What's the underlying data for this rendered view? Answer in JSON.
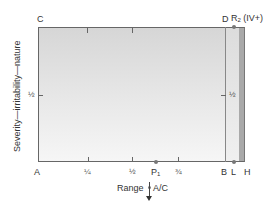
{
  "diagram": {
    "y_axis_label": "Severity—irritability—nature",
    "x_axis_label": "Range",
    "corners": {
      "top_left": "C",
      "top_right": "D",
      "bottom_left": "A",
      "bottom_right": "B"
    },
    "x_ticks": [
      {
        "label": "¼",
        "position": 0.25
      },
      {
        "label": "½",
        "position": 0.5
      },
      {
        "label": "¾",
        "position": 0.75
      }
    ],
    "y_tick_left": "½",
    "y_tick_right": "½",
    "points": {
      "p1": {
        "label": "P",
        "subscript": "1"
      },
      "r2": {
        "label": "R",
        "subscript": "2",
        "suffix": "(IV+)"
      },
      "l": {
        "label": "L"
      },
      "h": {
        "label": "H"
      }
    },
    "ac_marker": {
      "label": "A/C",
      "direction": "down"
    },
    "colors": {
      "plot_top": "#d6d6d6",
      "plot_bottom": "#f6f6f6",
      "h_band": "#a9a9a9",
      "axis": "#666666",
      "dot": "#777777"
    }
  }
}
